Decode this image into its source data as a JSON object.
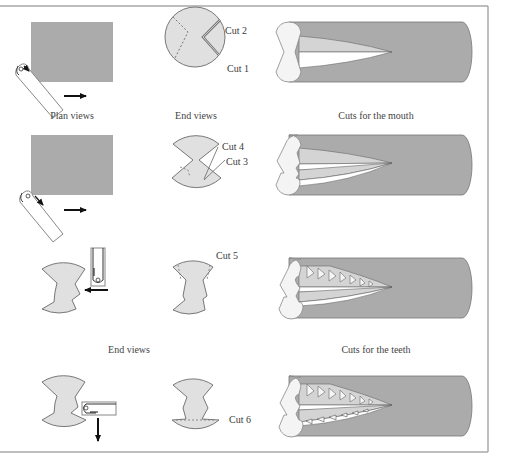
{
  "colors": {
    "frame": "#a8a8a8",
    "block_fill": "#ababab",
    "end_fill": "#e0e0e0",
    "outline": "#6e6e6e",
    "cut_face": "#d4d4d4",
    "arrow": "#111111"
  },
  "captions": {
    "plan_views": "Plan views",
    "end_views_top": "End views",
    "cuts_mouth": "Cuts for the mouth",
    "end_views_mid": "End views",
    "cuts_teeth": "Cuts for the teeth"
  },
  "cut_labels": {
    "cut1": "Cut 1",
    "cut2": "Cut 2",
    "cut3": "Cut 3",
    "cut4": "Cut 4",
    "cut5": "Cut 5",
    "cut6": "Cut 6"
  },
  "rows": [
    {
      "step": 1,
      "cuts": [
        "Cut 1",
        "Cut 2"
      ],
      "tool_view": "plan",
      "feed": "right"
    },
    {
      "step": 2,
      "cuts": [
        "Cut 3",
        "Cut 4"
      ],
      "tool_view": "plan",
      "feed": "right"
    },
    {
      "step": 3,
      "cuts": [
        "Cut 5"
      ],
      "tool_view": "end",
      "feed": "left"
    },
    {
      "step": 4,
      "cuts": [
        "Cut 6"
      ],
      "tool_view": "end",
      "feed": "down"
    }
  ]
}
